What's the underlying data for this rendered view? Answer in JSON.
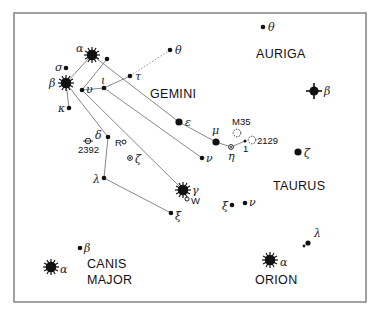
{
  "chart_data": {
    "type": "star-map",
    "title": "",
    "frame": {
      "x": 14,
      "y": 13,
      "width": 352,
      "height": 289
    },
    "constellations": [
      {
        "name": "GEMINI",
        "label_x": 150,
        "label_y": 98
      },
      {
        "name": "AURIGA",
        "label_x": 256,
        "label_y": 58
      },
      {
        "name": "TAURUS",
        "label_x": 273,
        "label_y": 190
      },
      {
        "name": "CANIS",
        "label_x": 87,
        "label_y": 268
      },
      {
        "name": "MAJOR",
        "label_x": 87,
        "label_y": 284
      },
      {
        "name": "ORION",
        "label_x": 255,
        "label_y": 284
      }
    ],
    "stars": [
      {
        "id": "gem-alpha",
        "label": "α",
        "x": 92,
        "y": 55,
        "size": "major",
        "label_dx": -16,
        "label_dy": -3
      },
      {
        "id": "gem-beta",
        "label": "β",
        "x": 66,
        "y": 83,
        "size": "major",
        "label_dx": -17,
        "label_dy": 4
      },
      {
        "id": "gem-sigma",
        "label": "σ",
        "x": 66,
        "y": 68,
        "size": "small",
        "label_dx": -11,
        "label_dy": 3
      },
      {
        "id": "gem-kappa",
        "label": "κ",
        "x": 69,
        "y": 108,
        "size": "small",
        "label_dx": -11,
        "label_dy": 4
      },
      {
        "id": "gem-upsilon",
        "label": "υ",
        "x": 82,
        "y": 90,
        "size": "small",
        "label_dx": 4,
        "label_dy": 3
      },
      {
        "id": "gem-iota",
        "label": "ι",
        "x": 104,
        "y": 88,
        "size": "small",
        "label_dx": -3,
        "label_dy": -4
      },
      {
        "id": "gem-tau",
        "label": "τ",
        "x": 130,
        "y": 76,
        "size": "small",
        "label_dx": 5,
        "label_dy": 4
      },
      {
        "id": "gem-theta",
        "label": "θ",
        "x": 170,
        "y": 50,
        "size": "small",
        "label_dx": 5,
        "label_dy": 4
      },
      {
        "id": "gem-rho",
        "label": "",
        "x": 107,
        "y": 59,
        "size": "small"
      },
      {
        "id": "gem-epsilon",
        "label": "ε",
        "x": 179,
        "y": 122,
        "size": "medium",
        "label_dx": 6,
        "label_dy": 4
      },
      {
        "id": "gem-mu",
        "label": "μ",
        "x": 216,
        "y": 142,
        "size": "medium",
        "label_dx": -4,
        "label_dy": -8
      },
      {
        "id": "gem-eta",
        "label": "η",
        "x": 231,
        "y": 147,
        "size": "open-small",
        "label_dx": -3,
        "label_dy": 13
      },
      {
        "id": "gem-1",
        "label": "1",
        "x": 245,
        "y": 141,
        "size": "tiny",
        "label_dx": -2,
        "label_dy": 11,
        "latin": true
      },
      {
        "id": "gem-nu",
        "label": "ν",
        "x": 202,
        "y": 158,
        "size": "small",
        "label_dx": 4,
        "label_dy": 4
      },
      {
        "id": "gem-delta",
        "label": "δ",
        "x": 108,
        "y": 137,
        "size": "small",
        "label_dx": -13,
        "label_dy": 2
      },
      {
        "id": "gem-zeta",
        "label": "ζ",
        "x": 130,
        "y": 158,
        "size": "open-small",
        "label_dx": 5,
        "label_dy": 5
      },
      {
        "id": "gem-lambda",
        "label": "λ",
        "x": 104,
        "y": 178,
        "size": "small",
        "label_dx": -11,
        "label_dy": 5
      },
      {
        "id": "gem-gamma",
        "label": "γ",
        "x": 183,
        "y": 190,
        "size": "major",
        "label_dx": 9,
        "label_dy": 4
      },
      {
        "id": "gem-xi",
        "label": "ξ",
        "x": 171,
        "y": 213,
        "size": "small",
        "label_dx": 4,
        "label_dy": 7
      },
      {
        "id": "aur-theta",
        "label": "θ",
        "x": 263,
        "y": 27,
        "size": "small",
        "label_dx": 5,
        "label_dy": 4
      },
      {
        "id": "aur-beta",
        "label": "β",
        "x": 314,
        "y": 91,
        "size": "major-4",
        "label_dx": 10,
        "label_dy": 4
      },
      {
        "id": "tau-zeta",
        "label": "ζ",
        "x": 298,
        "y": 152,
        "size": "medium",
        "label_dx": 6,
        "label_dy": 5
      },
      {
        "id": "tau-xi",
        "label": "ξ",
        "x": 232,
        "y": 205,
        "size": "small",
        "label_dx": -10,
        "label_dy": 5
      },
      {
        "id": "tau-nu",
        "label": "ν",
        "x": 245,
        "y": 203,
        "size": "small",
        "label_dx": 4,
        "label_dy": 3
      },
      {
        "id": "ori-lambda",
        "label": "λ",
        "x": 308,
        "y": 243,
        "size": "small-double",
        "label_dx": 6,
        "label_dy": -6
      },
      {
        "id": "ori-alpha",
        "label": "α",
        "x": 270,
        "y": 260,
        "size": "major",
        "label_dx": 10,
        "label_dy": 6
      },
      {
        "id": "cma-beta",
        "label": "β",
        "x": 80,
        "y": 248,
        "size": "small",
        "label_dx": 4,
        "label_dy": 4
      },
      {
        "id": "cma-alpha",
        "label": "α",
        "x": 51,
        "y": 267,
        "size": "major",
        "label_dx": 9,
        "label_dy": 6
      }
    ],
    "deep_sky": [
      {
        "id": "m35",
        "label": "M35",
        "x": 237,
        "y": 133,
        "type": "cluster",
        "label_dx": -5,
        "label_dy": -8
      },
      {
        "id": "ngc2129",
        "label": "2129",
        "x": 252,
        "y": 140,
        "type": "cluster",
        "label_dx": 5,
        "label_dy": 4
      },
      {
        "id": "ngc2392",
        "label": "2392",
        "x": 88,
        "y": 141,
        "type": "nebula",
        "label_dx": -10,
        "label_dy": 12
      },
      {
        "id": "r-gem",
        "label": "R",
        "x": 124,
        "y": 142,
        "type": "variable",
        "label_dx": -9,
        "label_dy": 4
      },
      {
        "id": "w-gem",
        "label": "W",
        "x": 187,
        "y": 199,
        "type": "variable",
        "label_dx": 4,
        "label_dy": 5
      }
    ],
    "lines": [
      {
        "from": "gem-beta",
        "to": "gem-alpha",
        "style": "solid"
      },
      {
        "from": "gem-beta",
        "to": "gem-kappa",
        "style": "solid"
      },
      {
        "from": "gem-alpha",
        "to": "gem-epsilon",
        "style": "solid"
      },
      {
        "from": "gem-epsilon",
        "to": "gem-mu",
        "style": "solid"
      },
      {
        "from": "gem-mu",
        "to": "gem-eta",
        "style": "solid"
      },
      {
        "from": "gem-eta",
        "to": "gem-1",
        "style": "solid"
      },
      {
        "from": "gem-rho",
        "to": "gem-upsilon",
        "style": "solid"
      },
      {
        "from": "gem-upsilon",
        "to": "gem-iota",
        "style": "solid"
      },
      {
        "from": "gem-iota",
        "to": "gem-tau",
        "style": "solid"
      },
      {
        "from": "gem-iota",
        "to": "gem-nu",
        "style": "solid"
      },
      {
        "from": "gem-upsilon",
        "to": "gem-gamma",
        "style": "solid"
      },
      {
        "from": "gem-beta",
        "to": "gem-delta",
        "style": "solid"
      },
      {
        "from": "gem-delta",
        "to": "gem-lambda",
        "style": "solid"
      },
      {
        "from": "gem-lambda",
        "to": "gem-xi",
        "style": "solid"
      },
      {
        "from": "gem-tau",
        "to": "gem-theta",
        "style": "dotted"
      }
    ]
  },
  "labels": {
    "gemini": "GEMINI",
    "auriga": "AURIGA",
    "taurus": "TAURUS",
    "canis": "CANIS",
    "major": "MAJOR",
    "orion": "ORION"
  }
}
